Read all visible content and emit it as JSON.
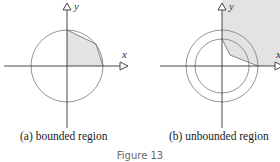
{
  "figure": {
    "title": "Figure 13",
    "panels": [
      {
        "id": "a",
        "caption": "(a)  bounded region",
        "x_label": "x",
        "y_label": "y",
        "description": "Circle centered at origin with shaded bounded region in first quadrant under polygonal path"
      },
      {
        "id": "b",
        "caption": "(b)  unbounded region",
        "x_label": "x",
        "y_label": "y",
        "description": "Two concentric circles with shaded unbounded region in first quadrant outside polygonal path"
      }
    ],
    "colors": {
      "shade": "#e3e3e3",
      "stroke": "#777777",
      "axis": "#333333"
    }
  }
}
